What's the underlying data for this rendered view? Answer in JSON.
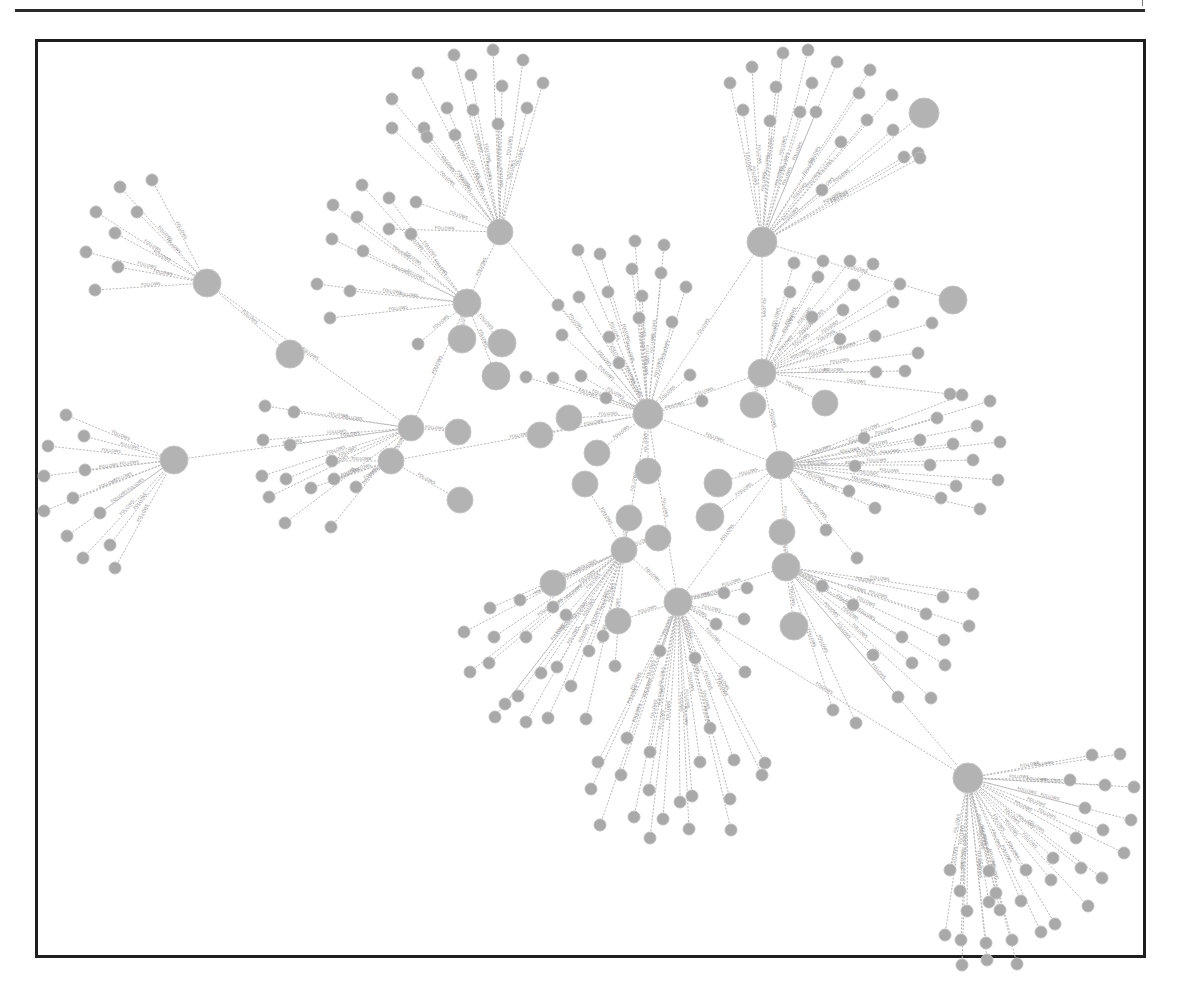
{
  "figure": {
    "type": "network-graph",
    "edge_label": "FOLLOWS",
    "colors": {
      "node": "#a9a9a9",
      "hub": "#b3b3b3",
      "edge": "#b8b8b8",
      "frame": "#1e1e1e"
    }
  },
  "hubs": [
    {
      "id": "h1",
      "x": 207,
      "y": 283,
      "r": 14,
      "leaves": [
        [
          152,
          180
        ],
        [
          120,
          187
        ],
        [
          137,
          212
        ],
        [
          96,
          212
        ],
        [
          115,
          233
        ],
        [
          86,
          252
        ],
        [
          118,
          267
        ],
        [
          95,
          290
        ]
      ]
    },
    {
      "id": "h2",
      "x": 174,
      "y": 460,
      "r": 14,
      "leaves": [
        [
          66,
          415
        ],
        [
          84,
          436
        ],
        [
          48,
          446
        ],
        [
          85,
          470
        ],
        [
          44,
          476
        ],
        [
          73,
          498
        ],
        [
          100,
          513
        ],
        [
          44,
          511
        ],
        [
          67,
          536
        ],
        [
          110,
          545
        ],
        [
          83,
          558
        ],
        [
          115,
          568
        ]
      ]
    },
    {
      "id": "h3",
      "x": 500,
      "y": 232,
      "r": 13,
      "leaves": [
        [
          454,
          55
        ],
        [
          493,
          50
        ],
        [
          523,
          60
        ],
        [
          418,
          73
        ],
        [
          471,
          75
        ],
        [
          502,
          86
        ],
        [
          543,
          83
        ],
        [
          392,
          99
        ],
        [
          447,
          108
        ],
        [
          424,
          128
        ],
        [
          473,
          110
        ],
        [
          527,
          108
        ],
        [
          392,
          128
        ],
        [
          427,
          137
        ],
        [
          455,
          135
        ],
        [
          498,
          124
        ],
        [
          389,
          229
        ],
        [
          416,
          202
        ]
      ]
    },
    {
      "id": "h4",
      "x": 467,
      "y": 303,
      "r": 14,
      "leaves": [
        [
          362,
          185
        ],
        [
          333,
          205
        ],
        [
          389,
          198
        ],
        [
          357,
          217
        ],
        [
          411,
          234
        ],
        [
          332,
          239
        ],
        [
          363,
          251
        ],
        [
          317,
          284
        ],
        [
          350,
          291
        ],
        [
          330,
          318
        ],
        [
          418,
          344
        ]
      ]
    },
    {
      "id": "h5",
      "x": 762,
      "y": 242,
      "r": 15,
      "leaves": [
        [
          783,
          53
        ],
        [
          808,
          50
        ],
        [
          752,
          67
        ],
        [
          837,
          62
        ],
        [
          730,
          83
        ],
        [
          776,
          87
        ],
        [
          812,
          83
        ],
        [
          870,
          70
        ],
        [
          743,
          110
        ],
        [
          800,
          112
        ],
        [
          859,
          93
        ],
        [
          892,
          95
        ],
        [
          770,
          121
        ],
        [
          816,
          112
        ],
        [
          867,
          120
        ],
        [
          893,
          130
        ],
        [
          918,
          153
        ],
        [
          841,
          142
        ],
        [
          904,
          157
        ],
        [
          822,
          190
        ],
        [
          920,
          158
        ]
      ]
    },
    {
      "id": "h6",
      "x": 648,
      "y": 414,
      "r": 15,
      "leaves": [
        [
          578,
          250
        ],
        [
          635,
          241
        ],
        [
          600,
          254
        ],
        [
          664,
          245
        ],
        [
          632,
          269
        ],
        [
          661,
          273
        ],
        [
          579,
          297
        ],
        [
          608,
          292
        ],
        [
          642,
          296
        ],
        [
          686,
          287
        ],
        [
          558,
          305
        ],
        [
          609,
          337
        ],
        [
          639,
          318
        ],
        [
          672,
          322
        ],
        [
          562,
          335
        ],
        [
          553,
          378
        ],
        [
          581,
          376
        ],
        [
          619,
          363
        ],
        [
          690,
          375
        ],
        [
          526,
          377
        ],
        [
          606,
          398
        ],
        [
          702,
          401
        ]
      ]
    },
    {
      "id": "h7",
      "x": 762,
      "y": 373,
      "r": 14,
      "leaves": [
        [
          794,
          263
        ],
        [
          823,
          261
        ],
        [
          850,
          261
        ],
        [
          790,
          292
        ],
        [
          818,
          277
        ],
        [
          873,
          264
        ],
        [
          854,
          285
        ],
        [
          900,
          284
        ],
        [
          812,
          317
        ],
        [
          843,
          310
        ],
        [
          893,
          302
        ],
        [
          840,
          339
        ],
        [
          875,
          336
        ],
        [
          932,
          323
        ],
        [
          876,
          372
        ],
        [
          905,
          371
        ],
        [
          918,
          353
        ],
        [
          950,
          394
        ]
      ]
    },
    {
      "id": "h8",
      "x": 780,
      "y": 465,
      "r": 14,
      "leaves": [
        [
          962,
          395
        ],
        [
          990,
          401
        ],
        [
          937,
          418
        ],
        [
          977,
          426
        ],
        [
          920,
          440
        ],
        [
          953,
          444
        ],
        [
          1000,
          442
        ],
        [
          973,
          460
        ],
        [
          864,
          438
        ],
        [
          930,
          465
        ],
        [
          855,
          466
        ],
        [
          998,
          480
        ],
        [
          956,
          486
        ],
        [
          875,
          508
        ],
        [
          941,
          498
        ],
        [
          980,
          509
        ],
        [
          849,
          491
        ],
        [
          826,
          530
        ],
        [
          857,
          558
        ]
      ]
    },
    {
      "id": "h9",
      "x": 786,
      "y": 567,
      "r": 14,
      "leaves": [
        [
          973,
          594
        ],
        [
          943,
          597
        ],
        [
          822,
          586
        ],
        [
          853,
          605
        ],
        [
          926,
          614
        ],
        [
          969,
          626
        ],
        [
          902,
          637
        ],
        [
          944,
          640
        ],
        [
          873,
          655
        ],
        [
          912,
          663
        ],
        [
          945,
          665
        ],
        [
          898,
          697
        ],
        [
          931,
          698
        ],
        [
          833,
          710
        ],
        [
          856,
          723
        ]
      ]
    },
    {
      "id": "h10",
      "x": 678,
      "y": 602,
      "r": 14,
      "leaves": [
        [
          724,
          593
        ],
        [
          747,
          588
        ],
        [
          744,
          619
        ],
        [
          716,
          624
        ],
        [
          660,
          651
        ],
        [
          695,
          658
        ],
        [
          745,
          672
        ],
        [
          710,
          728
        ],
        [
          627,
          738
        ],
        [
          650,
          752
        ],
        [
          700,
          762
        ],
        [
          734,
          760
        ],
        [
          765,
          763
        ],
        [
          762,
          775
        ],
        [
          649,
          790
        ],
        [
          692,
          796
        ],
        [
          598,
          762
        ],
        [
          621,
          775
        ],
        [
          591,
          789
        ],
        [
          680,
          802
        ],
        [
          730,
          799
        ],
        [
          634,
          817
        ],
        [
          663,
          819
        ],
        [
          600,
          825
        ],
        [
          689,
          829
        ],
        [
          731,
          830
        ],
        [
          650,
          838
        ]
      ]
    },
    {
      "id": "h11",
      "x": 624,
      "y": 550,
      "r": 13,
      "leaves": [
        [
          490,
          608
        ],
        [
          520,
          600
        ],
        [
          553,
          607
        ],
        [
          566,
          615
        ],
        [
          464,
          632
        ],
        [
          494,
          637
        ],
        [
          526,
          637
        ],
        [
          489,
          663
        ],
        [
          557,
          667
        ],
        [
          470,
          672
        ],
        [
          518,
          696
        ],
        [
          541,
          673
        ],
        [
          505,
          704
        ],
        [
          571,
          686
        ],
        [
          495,
          717
        ],
        [
          548,
          718
        ],
        [
          526,
          722
        ],
        [
          615,
          666
        ],
        [
          603,
          636
        ],
        [
          589,
          651
        ],
        [
          586,
          719
        ]
      ]
    },
    {
      "id": "h12",
      "x": 968,
      "y": 778,
      "r": 15,
      "leaves": [
        [
          1092,
          755
        ],
        [
          1120,
          754
        ],
        [
          1070,
          780
        ],
        [
          1105,
          785
        ],
        [
          1134,
          787
        ],
        [
          1085,
          808
        ],
        [
          1131,
          820
        ],
        [
          1103,
          830
        ],
        [
          1076,
          838
        ],
        [
          1124,
          853
        ],
        [
          1053,
          858
        ],
        [
          1081,
          868
        ],
        [
          1102,
          878
        ],
        [
          989,
          871
        ],
        [
          1026,
          870
        ],
        [
          1051,
          880
        ],
        [
          1088,
          906
        ],
        [
          1021,
          901
        ],
        [
          1055,
          924
        ],
        [
          989,
          902
        ],
        [
          967,
          911
        ],
        [
          1012,
          940
        ],
        [
          986,
          943
        ],
        [
          945,
          935
        ],
        [
          987,
          960
        ],
        [
          1041,
          932
        ],
        [
          1017,
          964
        ],
        [
          962,
          965
        ],
        [
          961,
          940
        ],
        [
          1000,
          910
        ],
        [
          996,
          893
        ],
        [
          960,
          891
        ],
        [
          950,
          870
        ]
      ]
    },
    {
      "id": "h13",
      "x": 411,
      "y": 428,
      "r": 13,
      "leaves": [
        [
          265,
          406
        ],
        [
          294,
          412
        ],
        [
          263,
          440
        ],
        [
          290,
          445
        ],
        [
          262,
          476
        ],
        [
          286,
          479
        ],
        [
          269,
          497
        ],
        [
          285,
          523
        ],
        [
          331,
          527
        ]
      ]
    },
    {
      "id": "h14",
      "x": 391,
      "y": 461,
      "r": 13,
      "leaves": [
        [
          311,
          488
        ],
        [
          334,
          479
        ],
        [
          356,
          487
        ],
        [
          332,
          461
        ]
      ]
    }
  ],
  "satellites": [
    {
      "x": 924,
      "y": 113,
      "r": 15
    },
    {
      "x": 953,
      "y": 300,
      "r": 14
    },
    {
      "x": 290,
      "y": 354,
      "r": 14
    },
    {
      "x": 462,
      "y": 339,
      "r": 14
    },
    {
      "x": 502,
      "y": 343,
      "r": 14
    },
    {
      "x": 496,
      "y": 376,
      "r": 14
    },
    {
      "x": 458,
      "y": 432,
      "r": 13
    },
    {
      "x": 540,
      "y": 435,
      "r": 13
    },
    {
      "x": 569,
      "y": 418,
      "r": 13
    },
    {
      "x": 597,
      "y": 453,
      "r": 13
    },
    {
      "x": 585,
      "y": 484,
      "r": 13
    },
    {
      "x": 460,
      "y": 500,
      "r": 13
    },
    {
      "x": 648,
      "y": 471,
      "r": 13
    },
    {
      "x": 718,
      "y": 483,
      "r": 14
    },
    {
      "x": 710,
      "y": 517,
      "r": 14
    },
    {
      "x": 658,
      "y": 538,
      "r": 13
    },
    {
      "x": 629,
      "y": 518,
      "r": 13
    },
    {
      "x": 753,
      "y": 405,
      "r": 13
    },
    {
      "x": 825,
      "y": 403,
      "r": 13
    },
    {
      "x": 553,
      "y": 583,
      "r": 13
    },
    {
      "x": 618,
      "y": 621,
      "r": 13
    },
    {
      "x": 794,
      "y": 626,
      "r": 14
    },
    {
      "x": 782,
      "y": 532,
      "r": 13
    }
  ],
  "links": [
    [
      "h1",
      "h13"
    ],
    [
      "h2",
      "h13"
    ],
    [
      "h3",
      "h4"
    ],
    [
      "h3",
      "h6"
    ],
    [
      "h4",
      "h13"
    ],
    [
      "h5",
      "h7"
    ],
    [
      "h5",
      "h6"
    ],
    [
      "h6",
      "h8"
    ],
    [
      "h7",
      "h8"
    ],
    [
      "h8",
      "h9"
    ],
    [
      "h9",
      "h12"
    ],
    [
      "h10",
      "h12"
    ],
    [
      "h10",
      "h11"
    ],
    [
      "h11",
      "h6"
    ],
    [
      "h13",
      "h14"
    ],
    [
      "h14",
      "h6"
    ],
    [
      "h10",
      "h8"
    ],
    [
      "h6",
      "h10"
    ],
    [
      "h7",
      "h6"
    ],
    [
      "h9",
      "h10"
    ]
  ]
}
